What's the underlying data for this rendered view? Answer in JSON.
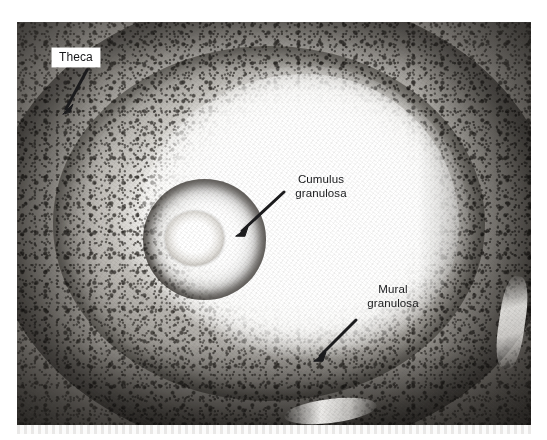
{
  "figure": {
    "kind": "histology-micrograph",
    "stain": "grayscale",
    "plate": {
      "x": 17,
      "y": 22,
      "width": 514,
      "height": 403,
      "background_color": "#cfcdc9",
      "page_background": "#ffffff"
    }
  },
  "palette": {
    "page": "#ffffff",
    "label_text": "#17181a",
    "label_box": "#ffffff",
    "leader_line": "#1b1b1d",
    "tissue_dark": "#3a3733",
    "tissue_mid": "#9b9894",
    "tissue_light": "#e8e6e2",
    "antrum": "#ffffff"
  },
  "annotations": [
    {
      "id": "theca",
      "label": "Theca",
      "boxed": true,
      "label_x": 52,
      "label_y": 48,
      "leader": {
        "x1": 87,
        "y1": 70,
        "x2": 64,
        "y2": 112
      },
      "points_to": "outer fibrous theca layer"
    },
    {
      "id": "cumulus",
      "label": "Cumulus\ngranulosa",
      "boxed": false,
      "label_x": 283,
      "label_y": 173,
      "leader": {
        "x1": 284,
        "y1": 192,
        "x2": 238,
        "y2": 234
      },
      "points_to": "cumulus oophorus surrounding the oocyte"
    },
    {
      "id": "mural",
      "label": "Mural\ngranulosa",
      "boxed": false,
      "label_x": 355,
      "label_y": 283,
      "leader": {
        "x1": 356,
        "y1": 320,
        "x2": 316,
        "y2": 359
      },
      "points_to": "mural granulosa lining the follicle wall"
    }
  ],
  "structures": {
    "theca_ring": "dark fibrous outer shell",
    "granulosa_band": "dense granulosa cell layer",
    "antrum": "follicular antrum (pale fluid-filled cavity)",
    "cumulus_mound": "cumulus oophorus",
    "oocyte": "oocyte with surrounding zona pellucida"
  }
}
